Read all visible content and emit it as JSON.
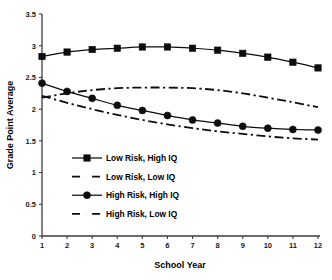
{
  "chart_data": {
    "type": "line",
    "title": "",
    "xlabel": "School Year",
    "ylabel": "Grade Point Average",
    "x": [
      1,
      2,
      3,
      4,
      5,
      6,
      7,
      8,
      9,
      10,
      11,
      12
    ],
    "xtick_labels": [
      "1",
      "2",
      "3",
      "4",
      "5",
      "6",
      "7",
      "8",
      "9",
      "10",
      "11",
      "12"
    ],
    "ytick_labels": [
      "0",
      "0.5",
      "1",
      "1.5",
      "2",
      "2.5",
      "3",
      "3.5"
    ],
    "ytick_values": [
      0,
      0.5,
      1,
      1.5,
      2,
      2.5,
      3,
      3.5
    ],
    "ylim": [
      0,
      3.5
    ],
    "xlim": [
      1,
      12
    ],
    "grid": false,
    "legend_position": "inside-lower-left",
    "series": [
      {
        "name": "Low Risk, High IQ",
        "style": "solid",
        "marker": "square",
        "values": [
          2.83,
          2.9,
          2.94,
          2.96,
          2.98,
          2.98,
          2.96,
          2.93,
          2.88,
          2.82,
          2.74,
          2.65
        ]
      },
      {
        "name": "Low Risk, Low IQ",
        "style": "dash-dot",
        "marker": "none",
        "values": [
          2.18,
          2.25,
          2.3,
          2.33,
          2.34,
          2.34,
          2.33,
          2.3,
          2.25,
          2.18,
          2.11,
          2.03
        ]
      },
      {
        "name": "High Risk, High IQ",
        "style": "solid",
        "marker": "circle",
        "values": [
          2.41,
          2.28,
          2.17,
          2.06,
          1.98,
          1.9,
          1.83,
          1.78,
          1.73,
          1.7,
          1.68,
          1.67
        ]
      },
      {
        "name": "High Risk, Low IQ",
        "style": "dash-dot",
        "marker": "none",
        "values": [
          2.21,
          2.1,
          2.0,
          1.91,
          1.83,
          1.76,
          1.7,
          1.65,
          1.61,
          1.57,
          1.54,
          1.52
        ]
      }
    ]
  },
  "axes": {
    "x_title": "School Year",
    "y_title": "Grade Point Average"
  },
  "legend": {
    "entries": [
      {
        "label": "Low Risk, High IQ"
      },
      {
        "label": "Low Risk, Low IQ"
      },
      {
        "label": "High Risk, High IQ"
      },
      {
        "label": "High Risk, Low IQ"
      }
    ]
  },
  "colors": {
    "series": "#0d0d0d",
    "axis": "#3d3d3d",
    "background": "#ffffff"
  }
}
